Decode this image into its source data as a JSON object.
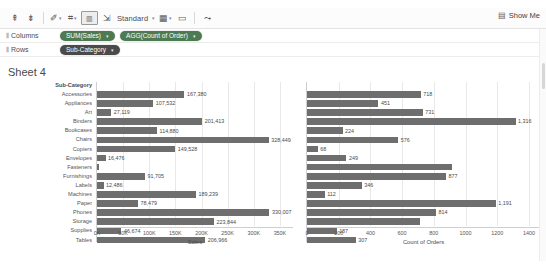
{
  "toolbar": {
    "items": [
      {
        "name": "sort-ascending-icon",
        "glyph": "⇞",
        "caret": false
      },
      {
        "name": "sort-descending-icon",
        "glyph": "⇟",
        "caret": false
      },
      {
        "name": "highlight-icon",
        "glyph": "✎",
        "caret": true
      },
      {
        "name": "group-members-icon",
        "glyph": "⌗",
        "caret": true
      },
      {
        "name": "totals-icon",
        "glyph": "▥",
        "caret": false,
        "boxed": true
      },
      {
        "name": "fix-axes-icon",
        "glyph": "⇱",
        "caret": false
      },
      {
        "name": "cell-size-icon",
        "glyph": "▦",
        "caret": true
      },
      {
        "name": "fit-icon",
        "glyph": "▭",
        "caret": false
      },
      {
        "name": "share-icon",
        "glyph": "⤳",
        "caret": false
      }
    ],
    "fit_label": "Standard",
    "show_me_label": "Show Me",
    "show_me_icon": "grid-icon"
  },
  "shelves": {
    "columns_label": "Columns",
    "rows_label": "Rows",
    "columns_pills": [
      {
        "label": "SUM(Sales)",
        "color": "green"
      },
      {
        "label": "AGG(Count of Order)",
        "color": "green"
      }
    ],
    "rows_pills": [
      {
        "label": "Sub-Category",
        "color": "dark"
      }
    ]
  },
  "sheet": {
    "title": "Sheet 4"
  },
  "chart_data": {
    "type": "bar",
    "title": "Sheet 4",
    "orientation": "horizontal",
    "grid": true,
    "legend": "none",
    "row_header": "Sub-Category",
    "categories": [
      "Accessories",
      "Appliances",
      "Art",
      "Binders",
      "Bookcases",
      "Chairs",
      "Copiers",
      "Envelopes",
      "Fasteners",
      "Furnishings",
      "Labels",
      "Machines",
      "Paper",
      "Phones",
      "Storage",
      "Supplies",
      "Tables"
    ],
    "panels": [
      {
        "name": "sales",
        "xlabel": "Sales",
        "xlim": [
          0,
          375000
        ],
        "ticks": [
          "0K",
          "50K",
          "100K",
          "150K",
          "200K",
          "250K",
          "300K",
          "350K"
        ],
        "tick_values": [
          0,
          50000,
          100000,
          150000,
          200000,
          250000,
          300000,
          350000
        ],
        "values": [
          167380,
          107532,
          27119,
          201413,
          114880,
          328449,
          149528,
          16476,
          3024,
          91705,
          12486,
          189239,
          78479,
          330007,
          223844,
          46674,
          206966
        ],
        "labels": [
          "167,380",
          "107,532",
          "27,119",
          "201,413",
          "114,880",
          "328,449",
          "149,528",
          "16,476",
          "",
          "91,705",
          "12,486",
          "189,239",
          "78,479",
          "330,007",
          "223,844",
          "46,674",
          "206,966"
        ]
      },
      {
        "name": "count_of_orders",
        "xlabel": "Count of Orders",
        "xlim": [
          0,
          1470
        ],
        "ticks": [
          "0",
          "200",
          "400",
          "600",
          "800",
          "1000",
          "1200",
          "1400"
        ],
        "tick_values": [
          0,
          200,
          400,
          600,
          800,
          1000,
          1200,
          1400
        ],
        "values": [
          718,
          451,
          731,
          1316,
          224,
          576,
          68,
          249,
          914,
          877,
          346,
          112,
          1191,
          814,
          713,
          187,
          307
        ],
        "labels": [
          "718",
          "451",
          "731",
          "1,316",
          "224",
          "576",
          "68",
          "249",
          "",
          "877",
          "346",
          "112",
          "1,191",
          "814",
          "",
          "187",
          "307"
        ]
      }
    ]
  },
  "colors": {
    "bar": "#6e6e6e",
    "pill_green": "#4d7a52",
    "pill_dark": "#4a4a4a",
    "gridline": "#e8e8e8",
    "axis": "#cfcfcf"
  }
}
